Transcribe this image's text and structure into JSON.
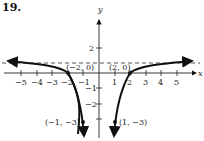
{
  "problem_number": "19.",
  "graph": {
    "x_axis_label": "x",
    "y_axis_label": "y",
    "x_ticks": [
      "−5",
      "−4",
      "−3",
      "−2",
      "−1",
      "1",
      "2",
      "3",
      "4",
      "5"
    ],
    "y_ticks": [
      "2",
      "−1",
      "−2",
      "−3"
    ],
    "asymptote": {
      "type": "horizontal",
      "y": 1,
      "style": "dashed"
    },
    "points": [
      {
        "label": "(−2, 0)",
        "x": -2,
        "y": 0
      },
      {
        "label": "(2, 0)",
        "x": 2,
        "y": 0
      },
      {
        "label": "(−1, −3)",
        "x": -1,
        "y": -3
      },
      {
        "label": "(1, −3)",
        "x": 1,
        "y": -3
      }
    ],
    "function": "y = 1 − 4/x²"
  }
}
